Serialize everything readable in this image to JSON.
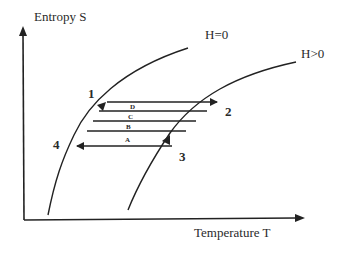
{
  "diagram": {
    "type": "thermodynamic-cycle",
    "y_axis": {
      "label": "Entropy S"
    },
    "x_axis": {
      "label": "Temperature  T"
    },
    "curves": [
      {
        "id": "h0",
        "label": "H=0"
      },
      {
        "id": "hpos",
        "label": "H>0"
      }
    ],
    "points": [
      {
        "id": "1",
        "label": "1"
      },
      {
        "id": "2",
        "label": "2"
      },
      {
        "id": "3",
        "label": "3"
      },
      {
        "id": "4",
        "label": "4"
      }
    ],
    "segments": [
      {
        "id": "D",
        "label": "D"
      },
      {
        "id": "C",
        "label": "C"
      },
      {
        "id": "B",
        "label": "B"
      },
      {
        "id": "A",
        "label": "A"
      }
    ],
    "colors": {
      "line": "#222222",
      "text": "#2a2a2a",
      "background": "#ffffff"
    }
  }
}
